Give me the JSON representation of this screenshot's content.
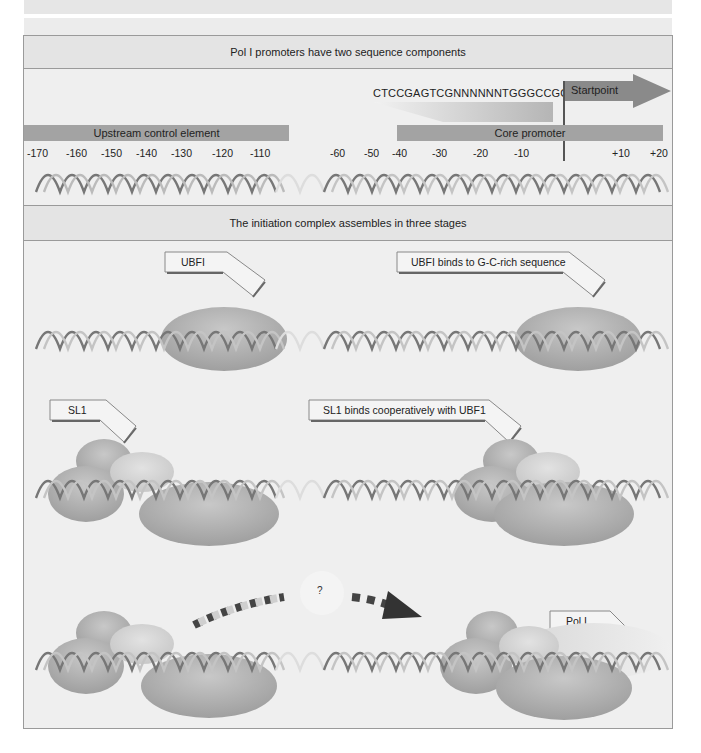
{
  "panel1": {
    "title": "Pol I promoters have two sequence components",
    "sequence": "CTCCGAGTCGNNNNNNTGGGCCGCCGG",
    "startpoint_label": "Startpoint",
    "upstream_label": "Upstream control element",
    "core_label": "Core promoter",
    "upstream_ticks": [
      "-170",
      "-160",
      "-150",
      "-140",
      "-130",
      "-120",
      "-110"
    ],
    "core_ticks": [
      "-60",
      "-50",
      "-40",
      "-30",
      "-20",
      "-10"
    ],
    "downstream_ticks": [
      "+10",
      "+20"
    ]
  },
  "panel2": {
    "title": "The initiation complex assembles in three stages",
    "stage1": {
      "left_callout": "UBFI",
      "right_callout": "UBFI binds to G-C-rich sequence"
    },
    "stage2": {
      "left_callout": "SL1",
      "right_callout": "SL1 binds cooperatively with UBF1"
    },
    "stage3": {
      "question": "?",
      "right_callout": "Pol I"
    }
  },
  "colors": {
    "frame_bg": "#efefef",
    "titlebar_bg": "#e4e4e4",
    "bar_gray": "#a3a3a3",
    "arrow_dark": "#7a7a7a",
    "protein_gray": "#a9a9a9",
    "protein_light": "#cfcfcf"
  }
}
